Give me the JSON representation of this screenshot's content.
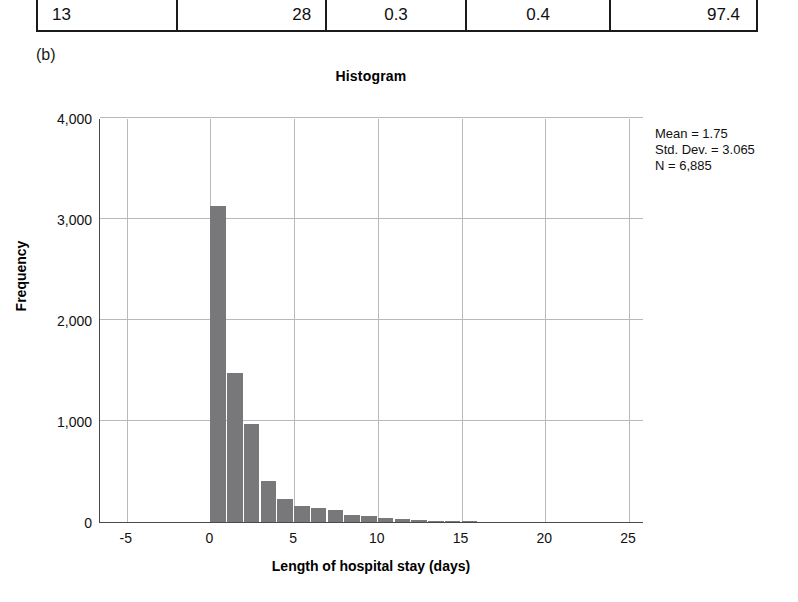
{
  "table_fragment": {
    "row_values": [
      "13",
      "28",
      "0.3",
      "0.4",
      "97.4"
    ]
  },
  "panel_label": "(b)",
  "stats": {
    "mean": "Mean = 1.75",
    "std_dev": "Std. Dev. = 3.065",
    "n": "N = 6,885"
  },
  "chart_data": {
    "type": "bar",
    "title": "Histogram",
    "xlabel": "Length of hospital stay (days)",
    "ylabel": "Frequency",
    "xlim": [
      -6.6,
      25.9
    ],
    "ylim": [
      0,
      4000
    ],
    "xticks": [
      -5,
      0,
      5,
      10,
      15,
      20,
      25
    ],
    "xtick_labels": [
      "-5",
      "0",
      "5",
      "10",
      "15",
      "20",
      "25"
    ],
    "yticks": [
      0,
      1000,
      2000,
      3000,
      4000
    ],
    "ytick_labels": [
      "0",
      "1,000",
      "2,000",
      "3,000",
      "4,000"
    ],
    "grid": true,
    "legend": "none",
    "bar_color": "#78787a",
    "bin_width": 1,
    "categories": [
      0,
      1,
      2,
      3,
      4,
      5,
      6,
      7,
      8,
      9,
      10,
      11,
      12,
      13,
      14,
      15
    ],
    "values": [
      3130,
      1480,
      975,
      410,
      225,
      160,
      135,
      120,
      65,
      55,
      40,
      30,
      22,
      15,
      12,
      8
    ]
  }
}
